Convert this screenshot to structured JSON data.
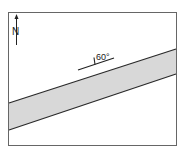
{
  "diagram": {
    "type": "geologic-map",
    "north_arrow": {
      "label": "N"
    },
    "strike_dip_symbol": {
      "dip_label": "60°"
    },
    "band": {
      "fill": "#d6d6d6",
      "edge": "#2a2a2a"
    },
    "frame": {
      "stroke": "#555555"
    }
  }
}
